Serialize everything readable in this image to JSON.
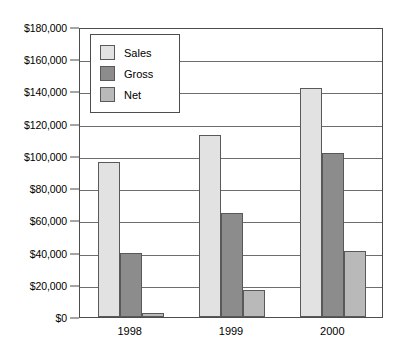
{
  "chart_data": {
    "type": "bar",
    "title": "",
    "xlabel": "",
    "ylabel": "",
    "categories": [
      "1998",
      "1999",
      "2000"
    ],
    "series": [
      {
        "name": "Sales",
        "color": "#e2e2e2",
        "values": [
          96000,
          113000,
          142000
        ]
      },
      {
        "name": "Gross",
        "color": "#8c8c8c",
        "values": [
          39800,
          64500,
          101500
        ]
      },
      {
        "name": "Net",
        "color": "#b9b9b9",
        "values": [
          2200,
          17000,
          41000
        ]
      }
    ],
    "ylim": [
      0,
      180000
    ],
    "ytick_step": 20000,
    "ytick_labels": [
      "$0",
      "$20,000",
      "$40,000",
      "$60,000",
      "$80,000",
      "$100,000",
      "$120,000",
      "$140,000",
      "$160,000",
      "$180,000"
    ],
    "grid": true,
    "legend_position": "top-left-inside",
    "grouped": true
  },
  "legend": {
    "entries": [
      {
        "label": "Sales"
      },
      {
        "label": "Gross"
      },
      {
        "label": "Net"
      }
    ]
  },
  "colors": {
    "sales": "#e2e2e2",
    "gross": "#8c8c8c",
    "net": "#b9b9b9",
    "axis": "#4d4d4d",
    "grid": "#6e6e6e",
    "bar_border": "#595959",
    "text": "#000000",
    "background": "#ffffff"
  }
}
